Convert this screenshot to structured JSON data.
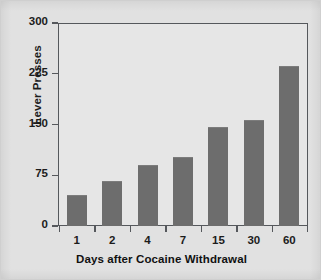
{
  "chart_data": {
    "type": "bar",
    "title": "",
    "xlabel": "Days after Cocaine Withdrawal",
    "ylabel": "Lever Presses",
    "categories": [
      "1",
      "2",
      "4",
      "7",
      "15",
      "30",
      "60"
    ],
    "values": [
      45,
      65,
      88,
      100,
      145,
      155,
      235
    ],
    "series": [
      {
        "name": "Lever Presses",
        "values": [
          45,
          65,
          88,
          100,
          145,
          155,
          235
        ]
      }
    ],
    "ylim": [
      0,
      300
    ],
    "yticks": [
      "0",
      "75",
      "150",
      "225",
      "300"
    ],
    "ytick_values": [
      0,
      75,
      150,
      225,
      300
    ],
    "xticks": [
      "1",
      "2",
      "4",
      "7",
      "15",
      "30",
      "60"
    ],
    "grid": false,
    "legend": null,
    "legend_position": "none",
    "colors": {
      "bar_fill": "#6d6d6d",
      "axis": "#55585c",
      "text": "#1c1c1c",
      "figure_background": "#e1e1e1",
      "plot_background": "#e6e6e6"
    }
  }
}
